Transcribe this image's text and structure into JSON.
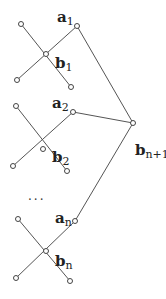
{
  "diagram": {
    "groups": [
      {
        "a_label": "a",
        "a_sub": "1",
        "b_label": "b",
        "b_sub": "1"
      },
      {
        "a_label": "a",
        "a_sub": "2",
        "b_label": "b",
        "b_sub": "2"
      },
      {
        "a_label": "a",
        "a_sub": "n",
        "b_label": "b",
        "b_sub": "n"
      }
    ],
    "ellipsis": "...",
    "root": {
      "label": "b",
      "sub": "n+1"
    }
  }
}
